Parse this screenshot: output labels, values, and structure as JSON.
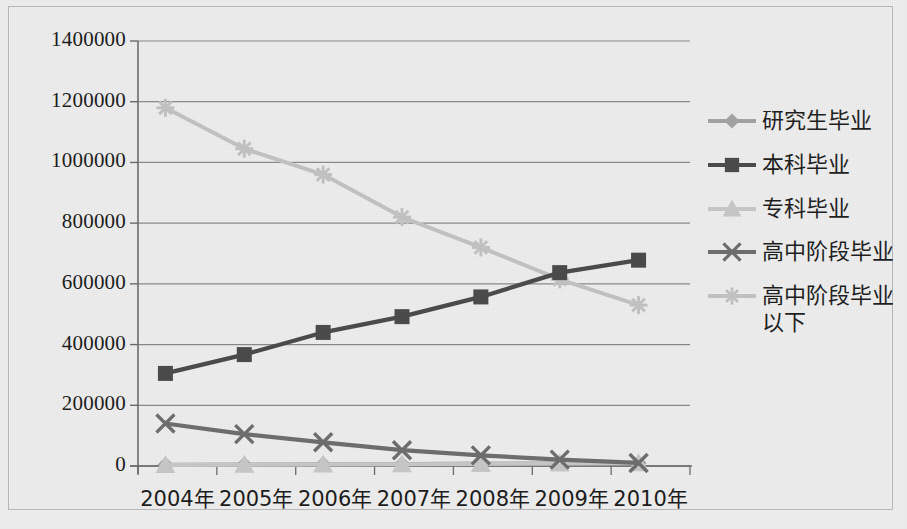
{
  "chart_data": {
    "type": "line",
    "title": "",
    "xlabel": "",
    "ylabel": "",
    "grid": true,
    "legend_position": "right",
    "categories": [
      "2004年",
      "2005年",
      "2006年",
      "2007年",
      "2008年",
      "2009年",
      "2010年"
    ],
    "ylim": [
      0,
      1400000
    ],
    "ytick_values": [
      0,
      200000,
      400000,
      600000,
      800000,
      1000000,
      1200000,
      1400000
    ],
    "ytick_labels": [
      "0",
      "200000",
      "400000",
      "600000",
      "800000",
      "1000000",
      "1200000",
      "1400000"
    ],
    "series": [
      {
        "name": "研究生毕业",
        "marker": "diamond",
        "color": "#a3a3a3",
        "values": [
          4000,
          5000,
          6000,
          7000,
          8000,
          9000,
          10000
        ]
      },
      {
        "name": "本科毕业",
        "marker": "square",
        "color": "#4a4a4a",
        "values": [
          305000,
          367000,
          440000,
          492000,
          557000,
          637000,
          678000
        ]
      },
      {
        "name": "专科毕业",
        "marker": "triangle",
        "color": "#c7c7c7",
        "values": [
          3000,
          4000,
          5000,
          6000,
          7000,
          8000,
          9000
        ]
      },
      {
        "name": "高中阶段毕业",
        "marker": "cross",
        "color": "#6d6d6d",
        "values": [
          140000,
          105000,
          78000,
          52000,
          35000,
          21000,
          10000
        ]
      },
      {
        "name": "高中阶段毕业\n以下",
        "marker": "star",
        "color": "#c2c2c2",
        "values": [
          1180000,
          1045000,
          960000,
          820000,
          720000,
          615000,
          530000
        ]
      }
    ]
  },
  "legend": {
    "items": [
      {
        "label": "研究生毕业"
      },
      {
        "label": "本科毕业"
      },
      {
        "label": "专科毕业"
      },
      {
        "label": "高中阶段毕业"
      },
      {
        "label": "高中阶段毕业\n以下"
      }
    ]
  },
  "axes": {
    "y_labels": [
      "1400000",
      "1200000",
      "1000000",
      "800000",
      "600000",
      "400000",
      "200000",
      "0"
    ],
    "x_labels": [
      "2004年",
      "2005年",
      "2006年",
      "2007年",
      "2008年",
      "2009年",
      "2010年"
    ]
  },
  "colors": {
    "background": "#ededed",
    "axis": "#6b6b6b",
    "grid": "#8a8a8a",
    "text": "#1b1b1b"
  }
}
